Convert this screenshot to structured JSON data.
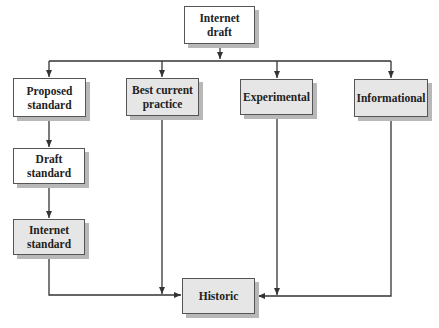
{
  "diagram": {
    "type": "flowchart",
    "title": "",
    "colors": {
      "white_fill": "#ffffff",
      "gray_fill": "#e6e6e6",
      "border": "#555555",
      "shadow": "#b8b8b8",
      "line": "#333333",
      "text": "#222222"
    },
    "nodes": [
      {
        "id": "internet-draft",
        "label": "Internet draft",
        "fill": "white"
      },
      {
        "id": "proposed-standard",
        "label": "Proposed standard",
        "fill": "white"
      },
      {
        "id": "best-current-practice",
        "label": "Best current practice",
        "fill": "gray"
      },
      {
        "id": "experimental",
        "label": "Experimental",
        "fill": "gray"
      },
      {
        "id": "informational",
        "label": "Informational",
        "fill": "gray"
      },
      {
        "id": "draft-standard",
        "label": "Draft standard",
        "fill": "white"
      },
      {
        "id": "internet-standard",
        "label": "Internet standard",
        "fill": "gray"
      },
      {
        "id": "historic",
        "label": "Historic",
        "fill": "gray"
      }
    ],
    "edges": [
      {
        "from": "internet-draft",
        "to": "proposed-standard"
      },
      {
        "from": "internet-draft",
        "to": "best-current-practice"
      },
      {
        "from": "internet-draft",
        "to": "experimental"
      },
      {
        "from": "internet-draft",
        "to": "informational"
      },
      {
        "from": "proposed-standard",
        "to": "draft-standard"
      },
      {
        "from": "draft-standard",
        "to": "internet-standard"
      },
      {
        "from": "internet-standard",
        "to": "historic"
      },
      {
        "from": "best-current-practice",
        "to": "historic"
      },
      {
        "from": "experimental",
        "to": "historic"
      },
      {
        "from": "informational",
        "to": "historic"
      }
    ]
  }
}
